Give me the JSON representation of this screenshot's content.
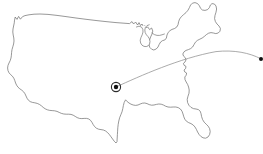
{
  "figure": {
    "background_color": "#ffffff",
    "width": 263,
    "height": 154
  },
  "map": {
    "region_label": "Continental United States",
    "outline_color": "#6b6b6b",
    "fill_color": "#ffffff",
    "outline_width": 0.7,
    "lakes_label": "Great Lakes",
    "country_outline_path": "M14.5,20.5 L15.2,17.0 L17.0,19.4 L18.6,16.4 L20.4,19.2 L22.6,16.6 L25.0,15.6 L29.0,14.8 L34.0,14.2 L40.0,14.0 L48.0,14.4 L57.0,15.4 L66.0,16.6 L76.0,18.0 L86.0,19.3 L96.0,20.5 L106.0,21.6 L116.0,22.6 L124.0,23.2 L129.5,23.6 L132.0,21.6 L133.6,24.0 L135.6,22.0 L137.6,25.0 L139.0,22.6 L140.6,25.6 L142.0,24.0 L143.4,26.6 L145.0,25.4 L146.4,28.0 L147.6,26.8 L149.6,29.6 L151.6,28.0 L152.8,31.0 L152.0,34.0 L150.6,37.0 L149.4,40.4 L148.8,44.0 L149.8,47.4 L151.6,49.2 L153.8,50.0 L156.2,49.0 L158.0,47.0 L159.2,44.4 L160.6,42.0 L162.6,40.6 L164.8,40.0 L166.4,38.0 L167.0,35.0 L168.2,32.4 L170.0,30.6 L172.0,29.4 L174.4,28.6 L176.6,27.2 L178.0,24.8 L178.6,21.8 L179.6,19.0 L181.4,16.6 L183.6,14.6 L186.0,12.6 L188.0,10.2 L189.4,7.6 L190.6,5.0 L192.4,3.2 L195.0,2.6 L197.6,3.6 L199.4,5.8 L200.6,8.4 L202.4,10.0 L205.0,10.4 L207.6,9.6 L209.4,7.6 L210.4,5.0 L212.0,3.6 L214.4,4.0 L216.0,6.0 L216.6,9.0 L216.0,12.2 L215.0,15.4 L214.6,18.6 L215.4,21.6 L217.0,24.0 L219.0,26.0 L220.4,28.4 L220.0,31.2 L218.2,33.0 L215.8,33.6 L213.4,33.0 L211.0,32.6 L208.6,33.2 L206.4,34.6 L204.4,36.4 L202.2,38.0 L199.8,39.2 L197.4,40.4 L195.4,42.2 L194.0,44.6 L192.6,47.0 L190.6,48.6 L188.4,49.6 L186.0,50.4 L184.0,51.8 L182.8,54.0 L183.6,56.2 L185.2,57.6 L186.0,59.8 L185.0,62.0 L183.4,63.4 L184.2,65.4 L186.0,66.4 L185.6,68.6 L184.0,70.0 L184.8,72.0 L186.6,73.0 L186.2,75.2 L184.8,77.0 L185.0,79.6 L186.2,82.0 L187.6,84.4 L188.6,87.0 L189.2,90.0 L189.0,93.2 L188.0,96.2 L187.2,99.4 L187.6,102.6 L189.0,105.4 L191.0,107.4 L193.4,108.6 L196.0,109.0 L198.4,109.6 L200.2,111.2 L201.0,113.6 L201.6,116.6 L202.6,119.6 L204.2,122.2 L206.2,124.2 L208.2,126.2 L209.6,128.6 L210.2,131.6 L209.6,134.6 L208.0,137.0 L205.6,138.2 L203.0,137.8 L200.8,136.4 L199.0,134.4 L197.6,132.0 L196.4,129.4 L195.0,127.0 L193.2,125.0 L191.0,123.6 L188.6,122.6 L186.4,121.2 L184.8,119.2 L183.8,116.8 L183.0,114.0 L182.0,111.2 L180.4,109.0 L178.2,107.6 L175.8,107.0 L173.2,107.0 L170.6,107.2 L168.0,107.0 L165.6,106.2 L163.4,105.0 L161.2,104.2 L158.8,104.0 L156.4,104.4 L154.0,105.0 L151.6,105.2 L149.2,104.6 L147.0,103.6 L144.8,103.0 L142.4,103.2 L140.2,104.0 L138.0,105.0 L135.6,105.4 L133.2,105.0 L131.0,104.2 L129.0,103.0 L127.2,101.6 L125.6,99.8 L124.2,102.4 L123.4,105.4 L122.8,108.6 L122.0,111.8 L120.8,114.8 L119.6,117.8 L118.8,121.0 L118.2,124.4 L117.8,127.8 L117.6,131.2 L117.4,134.6 L117.2,138.0 L117.0,141.6 L116.0,143.0 L114.2,141.2 L112.6,139.0 L111.0,136.8 L109.4,134.6 L107.6,132.6 L105.6,131.0 L103.4,130.0 L101.0,129.6 L98.6,129.2 L96.4,128.2 L94.6,126.6 L93.2,124.6 L92.0,122.4 L90.6,120.4 L88.8,119.0 L86.6,118.4 L84.2,118.4 L81.8,118.6 L79.4,118.4 L77.2,117.6 L75.2,116.4 L73.2,115.2 L71.0,114.4 L68.6,114.2 L66.2,114.2 L63.8,114.0 L61.4,113.4 L59.2,112.4 L57.0,111.4 L54.6,110.8 L52.2,110.6 L49.8,110.4 L47.4,109.8 L45.2,108.8 L43.2,107.4 L41.4,105.8 L39.4,104.4 L37.2,103.4 L34.8,102.8 L32.4,102.4 L30.2,101.6 L28.4,100.2 L27.0,98.2 L26.0,96.0 L25.0,93.8 L23.6,91.8 L21.8,90.2 L19.8,88.8 L18.0,87.2 L16.6,85.2 L15.6,83.0 L14.8,80.6 L13.8,78.2 L12.4,76.2 L10.6,74.6 L9.0,72.8 L8.0,70.6 L7.6,68.0 L8.0,65.4 L9.0,63.0 L10.2,60.6 L11.0,58.0 L11.4,55.2 L11.6,52.4 L12.0,49.6 L12.8,46.8 L13.6,44.0 L14.0,41.0 L13.8,38.0 L13.2,35.0 L12.8,32.0 L13.0,29.0 L13.6,26.0 L14.2,23.2 Z",
    "great_lakes_paths": [
      "M136.4,27.0 L139.0,26.2 L141.4,27.0 L142.8,29.2 L143.0,32.0 L142.2,34.8 L141.0,37.4 L140.2,40.2 L140.6,43.0 L142.0,45.2 L144.0,46.4 L146.2,46.6 L148.2,45.8 L149.6,44.0 L150.0,41.4 L149.4,38.8 L148.0,36.6 L146.4,34.8 L145.2,32.6 L144.8,30.0 L145.4,27.4 L147.0,25.6 L149.2,24.8",
      "M152.0,33.0 L154.4,34.6 L157.0,35.4 L159.6,35.4 L162.0,34.8 L164.4,34.0"
    ]
  },
  "route": {
    "label": "flight-route-arc",
    "arc_color": "#8f8f8f",
    "arc_width": 0.75,
    "arc_path": "M116.0,87.0 C140.0,76.0 180.0,58.0 216.0,51.6 C234.0,49.6 250.0,53.0 260.4,58.6",
    "origin": {
      "label": "origin-marker",
      "x": 116,
      "y": 87,
      "ring_radius": 4.6,
      "core_radius": 2.2,
      "ring_color": "#2b2b2b",
      "core_color": "#111111"
    },
    "destination": {
      "label": "destination-marker",
      "x": 261,
      "y": 59,
      "radius": 2.0,
      "color": "#111111"
    }
  }
}
